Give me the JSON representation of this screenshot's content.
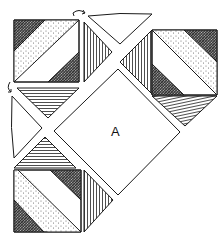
{
  "diagram": {
    "title": "",
    "center_piece_label": "A",
    "colors": {
      "line": "#1a1a1a",
      "background": "#ffffff",
      "dark_fill": "#3a3a3a",
      "dot_fill": "#6a6a6a"
    },
    "pieces": [
      {
        "id": "top-left-square",
        "pattern": "split-diagonal-dark-dotted-white-dark"
      },
      {
        "id": "top-left-vertical-hatched-triangle",
        "pattern": "vertical-lines"
      },
      {
        "id": "top-left-horizontal-hatched-triangle",
        "pattern": "horizontal-lines"
      },
      {
        "id": "top-white-triangle",
        "pattern": "plain"
      },
      {
        "id": "left-white-triangle",
        "pattern": "plain"
      },
      {
        "id": "top-right-square",
        "pattern": "split-diagonal-dotted-white-dark"
      },
      {
        "id": "top-right-vertical-hatched-triangle",
        "pattern": "vertical-lines"
      },
      {
        "id": "top-right-horizontal-hatched-triangle",
        "pattern": "diagonal-lines"
      },
      {
        "id": "center-square-A",
        "pattern": "plain",
        "label": "A"
      },
      {
        "id": "bottom-left-horizontal-hatched-triangle",
        "pattern": "horizontal-lines"
      },
      {
        "id": "bottom-left-square",
        "pattern": "split-diagonal-dotted-white-dark"
      },
      {
        "id": "bottom-left-vertical-hatched-triangle",
        "pattern": "vertical-lines"
      }
    ],
    "rotation_arrows": [
      {
        "id": "rotate-arrow-top",
        "glyph": "curved-arrow"
      },
      {
        "id": "rotate-arrow-left",
        "glyph": "curved-arrow"
      }
    ]
  }
}
